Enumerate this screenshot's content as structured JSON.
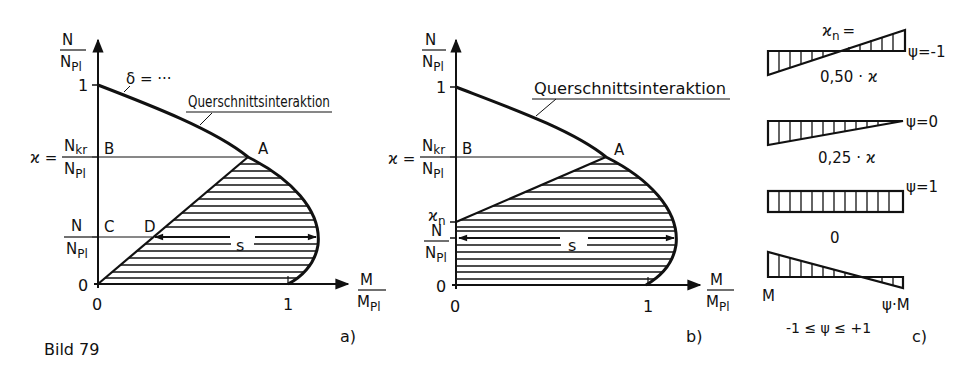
{
  "figure": {
    "caption": "Bild 79",
    "ink_color": "#111111",
    "background": "#ffffff"
  },
  "panel_a": {
    "label": "a)",
    "y_axis": {
      "num": "N",
      "den": "N",
      "den_sub": "Pl"
    },
    "x_axis": {
      "num": "M",
      "den": "M",
      "den_sub": "Pl"
    },
    "y_ticks": {
      "one": "1",
      "zero": "0"
    },
    "x_ticks": {
      "zero": "0",
      "one": "1"
    },
    "kappa_label": {
      "lhs": "ϰ =",
      "num": "N",
      "num_sub": "kr",
      "den": "N",
      "den_sub": "Pl"
    },
    "n_label": {
      "num": "N",
      "den": "N",
      "den_sub": "Pl"
    },
    "curve_title": "Querschnittsinteraktion",
    "delta_label": "δ = ···",
    "points": {
      "A": "A",
      "B": "B",
      "C": "C",
      "D": "D"
    },
    "s_label": "s"
  },
  "panel_b": {
    "label": "b)",
    "y_axis": {
      "num": "N",
      "den": "N",
      "den_sub": "Pl"
    },
    "x_axis": {
      "num": "M",
      "den": "M",
      "den_sub": "Pl"
    },
    "y_ticks": {
      "one": "1",
      "zero": "0"
    },
    "x_ticks": {
      "zero": "0",
      "one": "1"
    },
    "kappa_label": {
      "lhs": "ϰ =",
      "num": "N",
      "num_sub": "kr",
      "den": "N",
      "den_sub": "Pl"
    },
    "kappa_n": {
      "sym": "ϰ",
      "sub": "n"
    },
    "n_label": {
      "num": "N",
      "den": "N",
      "den_sub": "Pl"
    },
    "curve_title": "Querschnittsinteraktion",
    "points": {
      "A": "A",
      "B": "B"
    },
    "s_label": "s"
  },
  "panel_c": {
    "label": "c)",
    "kappa_n_eq": {
      "sym": "ϰ",
      "sub": "n",
      "eq": "="
    },
    "diagrams": [
      {
        "psi": "ψ=-1",
        "value": "0,50 · ϰ"
      },
      {
        "psi": "ψ=0",
        "value": "0,25 · ϰ"
      },
      {
        "psi": "ψ=1",
        "value": "0"
      },
      {
        "left": "M",
        "right": "ψ·M",
        "range": "-1 ≤ ψ ≤ +1"
      }
    ]
  }
}
